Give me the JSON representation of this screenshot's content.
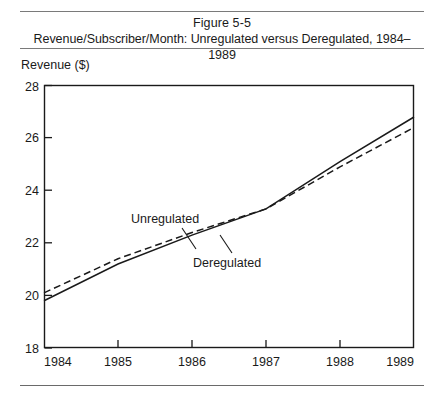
{
  "figure": {
    "number_label": "Figure 5-5",
    "caption": "Revenue/Subscriber/Month: Unregulated versus Deregulated, 1984–1989"
  },
  "axes": {
    "y_axis_title": "Revenue ($)",
    "y_ticks": [
      "18",
      "20",
      "22",
      "24",
      "26",
      "28"
    ],
    "x_ticks": [
      "1984",
      "1985",
      "1986",
      "1987",
      "1988",
      "1989"
    ]
  },
  "annotations": {
    "unregulated_label": "Unregulated",
    "deregulated_label": "Deregulated"
  },
  "colors": {
    "ink": "#1a1a1a",
    "rule": "#7a7a7a",
    "background": "#ffffff"
  },
  "chart_data": {
    "type": "line",
    "title": "Revenue/Subscriber/Month: Unregulated versus Deregulated, 1984–1989",
    "xlabel": "",
    "ylabel": "Revenue ($)",
    "x": [
      1984,
      1985,
      1986,
      1987,
      1988,
      1989
    ],
    "xlim": [
      1984,
      1989
    ],
    "ylim": [
      18,
      28
    ],
    "y_tick_values": [
      18,
      20,
      22,
      24,
      26,
      28
    ],
    "x_tick_values": [
      1984,
      1985,
      1986,
      1987,
      1988,
      1989
    ],
    "grid": false,
    "legend": "inline-annotations",
    "series": [
      {
        "name": "Unregulated",
        "style": "solid",
        "values": [
          19.8,
          21.2,
          22.3,
          23.3,
          25.1,
          26.8
        ]
      },
      {
        "name": "Deregulated",
        "style": "dashed",
        "values": [
          20.1,
          21.4,
          22.4,
          23.3,
          24.9,
          26.4
        ]
      }
    ]
  }
}
